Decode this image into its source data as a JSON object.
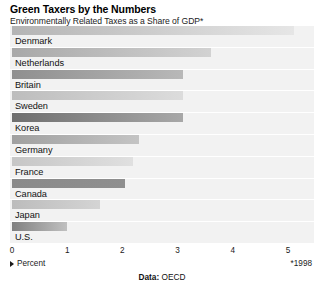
{
  "header": {
    "title": "Green Taxers by the Numbers",
    "subtitle": "Environmentally Related Taxes as a Share of GDP*"
  },
  "footer": {
    "axis_caption": "Percent",
    "caret_icon": "caret-right-icon",
    "footnote": "*1998",
    "source_prefix": "Data:",
    "source_name": "OECD"
  },
  "chart_data": {
    "type": "bar",
    "orientation": "horizontal",
    "title": "Green Taxers by the Numbers",
    "subtitle": "Environmentally Related Taxes as a Share of GDP*",
    "xlabel": "Percent",
    "ylabel": "",
    "xlim": [
      0,
      5
    ],
    "xticks": [
      0,
      1,
      2,
      3,
      4,
      5
    ],
    "xtick_labels": [
      "0",
      "1",
      "2",
      "3",
      "4",
      "5"
    ],
    "grid": false,
    "legend": null,
    "source": "Data: OECD",
    "footnote": "*1998",
    "categories": [
      "Denmark",
      "Netherlands",
      "Britain",
      "Sweden",
      "Korea",
      "Germany",
      "France",
      "Canada",
      "Japan",
      "U.S."
    ],
    "values": [
      5.1,
      3.6,
      3.1,
      3.1,
      3.1,
      2.3,
      2.2,
      2.05,
      1.6,
      1.0
    ],
    "bars": [
      {
        "label": "Denmark",
        "value": 5.1,
        "color_start": "#b4b4b4",
        "color_end": "#e6e6e6"
      },
      {
        "label": "Netherlands",
        "value": 3.6,
        "color_start": "#a8a8a8",
        "color_end": "#d2d2d2"
      },
      {
        "label": "Britain",
        "value": 3.1,
        "color_start": "#8f8f8f",
        "color_end": "#b8b8b8"
      },
      {
        "label": "Sweden",
        "value": 3.1,
        "color_start": "#bdbdbd",
        "color_end": "#dcdcdc"
      },
      {
        "label": "Korea",
        "value": 3.1,
        "color_start": "#6e6e6e",
        "color_end": "#a8a8a8"
      },
      {
        "label": "Germany",
        "value": 2.3,
        "color_start": "#a0a0a0",
        "color_end": "#c4c4c4"
      },
      {
        "label": "France",
        "value": 2.2,
        "color_start": "#c6c6c6",
        "color_end": "#e0e0e0"
      },
      {
        "label": "Canada",
        "value": 2.05,
        "color_start": "#8a8a8a",
        "color_end": "#8f8f8f"
      },
      {
        "label": "Japan",
        "value": 1.6,
        "color_start": "#bcbcbc",
        "color_end": "#d4d4d4"
      },
      {
        "label": "U.S.",
        "value": 1.0,
        "color_start": "#808080",
        "color_end": "#c0c0c0"
      }
    ],
    "colors": {
      "plot_background": "#f2f2f2",
      "page_background": "#ffffff",
      "text": "#111111"
    }
  }
}
